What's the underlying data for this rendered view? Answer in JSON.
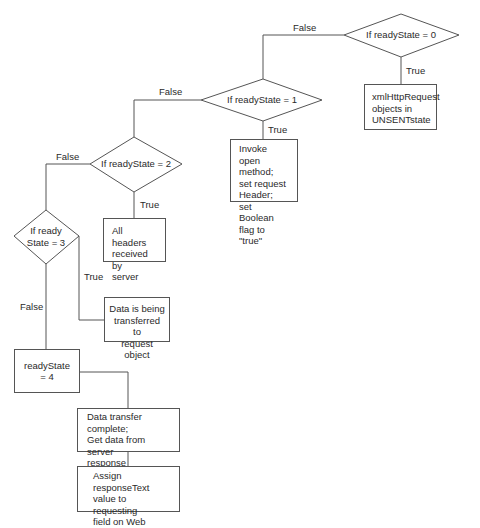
{
  "diagram": {
    "type": "flowchart",
    "decisions": [
      {
        "id": "d0",
        "label": "If readyState = 0",
        "true_label": "True",
        "false_label": "False"
      },
      {
        "id": "d1",
        "label": "If readyState = 1",
        "true_label": "True",
        "false_label": "False"
      },
      {
        "id": "d2",
        "label": "If readyState = 2",
        "true_label": "True",
        "false_label": "False"
      },
      {
        "id": "d3",
        "label_line1": "If ready",
        "label_line2": "State = 3",
        "true_label": "True",
        "false_label": "False"
      }
    ],
    "boxes": [
      {
        "id": "b0",
        "text": "xmlHttpRequest\nobjects in\nUNSENTstate"
      },
      {
        "id": "b1",
        "text": "Invoke open\nmethod;\nset request\nHeader;\nset Boolean\nflag to \"true\""
      },
      {
        "id": "b2",
        "text": "All headers\nreceived by\nserver"
      },
      {
        "id": "b3",
        "text": "Data is being\ntransferred to\nrequest object"
      },
      {
        "id": "b4",
        "text": "readyState = 4"
      },
      {
        "id": "b5",
        "text": "Data transfer complete;\nGet data from server\nresponse (responseText\nproperty)"
      },
      {
        "id": "b6",
        "text": "Assign responseText\nvalue to requesting\nfield on Web\ndocument"
      }
    ],
    "edges": [
      {
        "from": "d0",
        "to": "b0",
        "label": "True"
      },
      {
        "from": "d0",
        "to": "d1",
        "label": "False"
      },
      {
        "from": "d1",
        "to": "b1",
        "label": "True"
      },
      {
        "from": "d1",
        "to": "d2",
        "label": "False"
      },
      {
        "from": "d2",
        "to": "b2",
        "label": "True"
      },
      {
        "from": "d2",
        "to": "d3",
        "label": "False"
      },
      {
        "from": "d3",
        "to": "b3",
        "label": "True"
      },
      {
        "from": "d3",
        "to": "b4",
        "label": "False"
      },
      {
        "from": "b4",
        "to": "b5",
        "label": ""
      },
      {
        "from": "b5",
        "to": "b6",
        "label": ""
      }
    ],
    "colors": {
      "line": "#555555",
      "text": "#2a2a2a",
      "background": "#ffffff"
    }
  }
}
